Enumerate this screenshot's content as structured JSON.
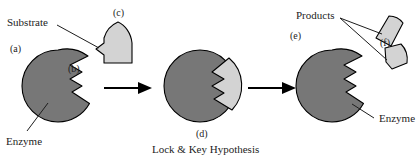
{
  "figure": {
    "caption": "Lock & Key Hypothesis",
    "colors": {
      "enzyme_fill": "#777777",
      "substrate_fill": "#d3d3d3",
      "outline": "#000000",
      "text": "#1d1d1d",
      "background": "#ffffff"
    },
    "labels": {
      "substrate": "Substrate",
      "enzyme_left": "Enzyme",
      "enzyme_right": "Enzyme",
      "products": "Products",
      "a": "(a)",
      "b": "(b)",
      "c": "(c)",
      "d": "(d)",
      "e": "(e)",
      "f": "(f)"
    },
    "stages": [
      {
        "id": "stage-1",
        "key": "a",
        "description": "Free enzyme with active site notch and free substrate"
      },
      {
        "id": "stage-2",
        "key": "d",
        "description": "Enzyme-substrate complex, substrate bound in active site"
      },
      {
        "id": "stage-3",
        "key": "e",
        "description": "Enzyme releasing two cleaved product fragments"
      }
    ],
    "arrows": [
      {
        "id": "arrow-1",
        "from": "stage-1",
        "to": "stage-2"
      },
      {
        "id": "arrow-2",
        "from": "stage-2",
        "to": "stage-3"
      }
    ]
  }
}
